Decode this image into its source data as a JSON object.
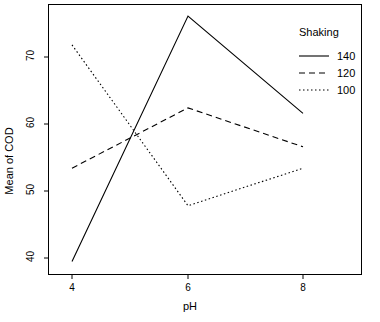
{
  "chart_data": {
    "type": "line",
    "title": "",
    "subtitle": "",
    "xlabel": "pH",
    "ylabel": "Mean of COD",
    "categories": [
      "4",
      "6",
      "8"
    ],
    "x": [
      4,
      6,
      8
    ],
    "xlim": [
      3.6,
      8.4
    ],
    "ylim": [
      38.5,
      77.5
    ],
    "xticks": [
      "4",
      "6",
      "8"
    ],
    "yticks": [
      "40",
      "50",
      "60",
      "70"
    ],
    "ytick_values": [
      40,
      50,
      60,
      70
    ],
    "grid": false,
    "legend_position": "top-right",
    "legend_title": "Shaking",
    "series": [
      {
        "name": "140",
        "linestyle": "solid",
        "color": "#000000",
        "values": [
          39.5,
          76.1,
          61.6
        ]
      },
      {
        "name": "120",
        "linestyle": "dashed",
        "color": "#000000",
        "values": [
          53.4,
          62.4,
          56.6
        ]
      },
      {
        "name": "100",
        "linestyle": "dotted",
        "color": "#000000",
        "values": [
          71.8,
          47.8,
          53.4
        ]
      }
    ]
  },
  "legend": {
    "title": "Shaking",
    "entries": [
      {
        "label": "140",
        "style": "solid"
      },
      {
        "label": "120",
        "style": "dashed"
      },
      {
        "label": "100",
        "style": "dotted"
      }
    ]
  },
  "axes": {
    "x_title": "pH",
    "y_title": "Mean of COD",
    "x_ticks": [
      "4",
      "6",
      "8"
    ],
    "y_ticks": [
      "70",
      "60",
      "50",
      "40"
    ]
  }
}
